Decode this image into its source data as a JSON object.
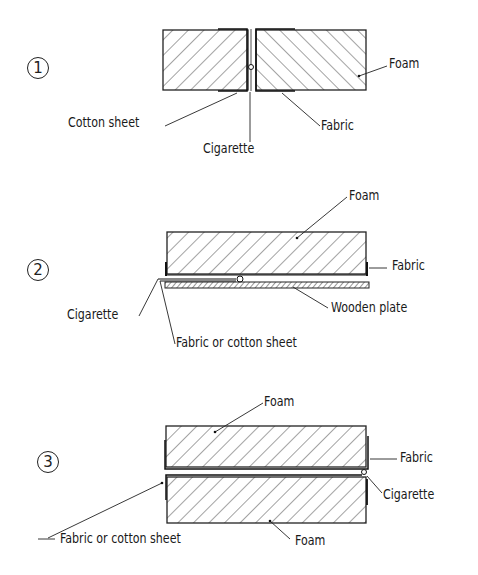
{
  "diagram": {
    "panels": [
      {
        "number": "1",
        "labels": {
          "foam": "Foam",
          "cotton_sheet": "Cotton sheet",
          "cigarette": "Cigarette",
          "fabric": "Fabric"
        }
      },
      {
        "number": "2",
        "labels": {
          "foam": "Foam",
          "fabric": "Fabric",
          "cigarette": "Cigarette",
          "wooden_plate": "Wooden plate",
          "fabric_or_cotton": "Fabric or cotton sheet"
        }
      },
      {
        "number": "3",
        "labels": {
          "foam_top": "Foam",
          "fabric": "Fabric",
          "cigarette": "Cigarette",
          "fabric_or_cotton": "Fabric  or cotton sheet",
          "foam_bottom": "Foam"
        }
      }
    ]
  }
}
